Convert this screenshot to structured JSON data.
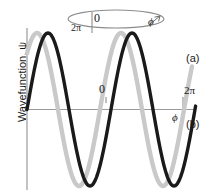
{
  "figure": {
    "type": "line",
    "axis_color": "#8c8c8c",
    "curve_a_color": "#c9c9c9",
    "curve_b_color": "#1a1a1a",
    "ylabel": "Wavefunction, ψ",
    "labels": {
      "ellipse_zero": "0",
      "ellipse_twopi": "2π",
      "ellipse_phi": "ϕ",
      "mid_zero": "0",
      "right_twopi": "2π",
      "right_phi": "ϕ",
      "curve_a": "(a)",
      "curve_b": "(b)"
    }
  },
  "chart_data": {
    "type": "line",
    "title": "",
    "xlabel": "ϕ",
    "ylabel": "Wavefunction, ψ",
    "xlim": [
      0,
      6.283185
    ],
    "ylim": [
      -1.15,
      1.15
    ],
    "grid": false,
    "legend_position": "right",
    "xticks": [
      0,
      6.283185
    ],
    "xticklabels": [
      "0",
      "2π"
    ],
    "annotations": [
      {
        "text": "0",
        "note": "phase origin on ring and on phi-axis"
      },
      {
        "text": "2π",
        "note": "phase end, wraps to 0"
      },
      {
        "text": "ϕ",
        "note": "azimuthal angle, arrow shows sense of increase around ring"
      }
    ],
    "series": [
      {
        "name": "(a)",
        "color": "#c9c9c9",
        "description": "acceptable wavefunction — integer number of wavelengths, single valued at ϕ = 0 and 2π",
        "form": "cos(mϕ) with integer m = 2.4 cycles drawn",
        "x": [
          0.0,
          0.25,
          0.5,
          0.75,
          1.0,
          1.25,
          1.5,
          1.75,
          2.0,
          2.25,
          2.5,
          2.75,
          3.0,
          3.25,
          3.5,
          3.75,
          4.0,
          4.25,
          4.5,
          4.75,
          5.0,
          5.25,
          5.5,
          5.75,
          6.0,
          6.283185
        ],
        "y": [
          0.0,
          0.62,
          0.96,
          0.95,
          0.58,
          0.05,
          -0.52,
          -0.91,
          -1.0,
          -0.72,
          -0.22,
          0.38,
          0.84,
          1.0,
          0.8,
          0.32,
          -0.28,
          -0.78,
          -1.0,
          -0.86,
          -0.44,
          0.16,
          0.7,
          0.98,
          0.9,
          0.6
        ]
      },
      {
        "name": "(b)",
        "color": "#1a1a1a",
        "description": "unacceptable wavefunction — non-integer number of wavelengths, not single valued after one full circuit",
        "form": "cos(mϕ) with non-integer m, lagging (a) in phase",
        "x": [
          0.0,
          0.25,
          0.5,
          0.75,
          1.0,
          1.25,
          1.5,
          1.75,
          2.0,
          2.25,
          2.5,
          2.75,
          3.0,
          3.25,
          3.5,
          3.75,
          4.0,
          4.25,
          4.5,
          4.75,
          5.0,
          5.25,
          5.5,
          5.75,
          6.0,
          6.283185
        ],
        "y": [
          0.0,
          0.45,
          0.82,
          1.0,
          0.92,
          0.6,
          0.1,
          -0.44,
          -0.85,
          -1.0,
          -0.88,
          -0.5,
          0.02,
          0.55,
          0.9,
          1.0,
          0.82,
          0.4,
          -0.16,
          -0.66,
          -0.95,
          -0.99,
          -0.76,
          -0.32,
          0.2,
          0.58
        ]
      }
    ]
  }
}
